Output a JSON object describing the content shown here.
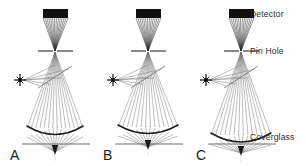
{
  "figure": {
    "type": "optical-ray-diagram",
    "title_visible": false,
    "background_color": "#ffffff",
    "ink_color": "#1a1a1a",
    "ray_color": "#6e6e6e"
  },
  "right_labels": [
    {
      "id": "detector",
      "text": "Detector",
      "x": 250,
      "y": 17,
      "anchor_y": 13
    },
    {
      "id": "pinhole",
      "text": "Pin Hole",
      "x": 250,
      "y": 54,
      "anchor_y": 51
    },
    {
      "id": "coverglass",
      "text": "Coverglass",
      "x": 250,
      "y": 140,
      "anchor_y": 144
    }
  ],
  "panels": [
    {
      "id": "A",
      "label": "A",
      "label_x": 10,
      "label_y": 160,
      "axis_x": 55,
      "focus_depth": "below-coverglass",
      "detector": {
        "x": 43,
        "y": 9,
        "width": 25,
        "height": 9
      },
      "pinhole": {
        "x1": 38,
        "x2": 73,
        "y": 51,
        "gap": 2
      },
      "lens": {
        "cx": 55,
        "y_top": 126,
        "y_bottom": 137,
        "half_width": 28
      },
      "coverglass": {
        "x1": 22,
        "x2": 90,
        "y": 144
      },
      "focus": {
        "x": 55,
        "y": 152
      },
      "source": {
        "x": 20,
        "y": 80,
        "radius": 6
      },
      "beamsplitter": {
        "x1": 38,
        "y1": 88,
        "x2": 72,
        "y2": 66
      },
      "ray_count": 13
    },
    {
      "id": "B",
      "label": "B",
      "label_x": 103,
      "label_y": 160,
      "axis_x": 148,
      "focus_depth": "at-coverglass",
      "detector": {
        "x": 136,
        "y": 9,
        "width": 25,
        "height": 9
      },
      "pinhole": {
        "x1": 131,
        "x2": 166,
        "y": 51,
        "gap": 2
      },
      "lens": {
        "cx": 148,
        "y_top": 125,
        "y_bottom": 136,
        "half_width": 30
      },
      "coverglass": {
        "x1": 115,
        "x2": 183,
        "y": 144
      },
      "focus": {
        "x": 148,
        "y": 147
      },
      "source": {
        "x": 113,
        "y": 80,
        "radius": 6
      },
      "beamsplitter": {
        "x1": 131,
        "y1": 88,
        "x2": 165,
        "y2": 66
      },
      "ray_count": 13
    },
    {
      "id": "C",
      "label": "C",
      "label_x": 196,
      "label_y": 160,
      "axis_x": 241,
      "focus_depth": "above-coverglass",
      "detector": {
        "x": 229,
        "y": 9,
        "width": 25,
        "height": 9
      },
      "pinhole": {
        "x1": 224,
        "x2": 259,
        "y": 51,
        "gap": 2
      },
      "lens": {
        "cx": 241,
        "y_top": 133,
        "y_bottom": 145,
        "half_width": 30
      },
      "coverglass": {
        "x1": 208,
        "x2": 276,
        "y": 144
      },
      "focus": {
        "x": 241,
        "y": 153
      },
      "source": {
        "x": 206,
        "y": 80,
        "radius": 6
      },
      "beamsplitter": {
        "x1": 224,
        "y1": 88,
        "x2": 258,
        "y2": 66
      },
      "ray_count": 13
    }
  ],
  "legend": {
    "description": "Confocal ray paths for three focus depths relative to the coverglass"
  }
}
